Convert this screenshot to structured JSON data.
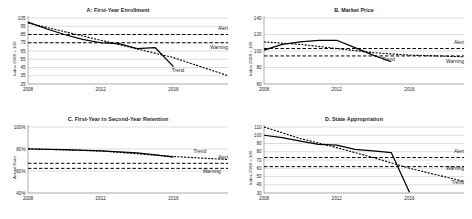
{
  "figure": {
    "width": 472,
    "height": 219,
    "background": "#ffffff",
    "line_color": "#000000",
    "grid_color": "#a7a9ac"
  },
  "chart_data": [
    {
      "type": "line",
      "panel": "A",
      "title": "A: First-Year Enrollment",
      "xlabel": "",
      "ylabel": "Index 2008 = 100",
      "xlim": [
        2008,
        2019
      ],
      "ylim": [
        25,
        105
      ],
      "yticks": [
        25,
        35,
        45,
        55,
        65,
        75,
        85,
        95,
        105
      ],
      "ytick_labels": [
        "25",
        "35",
        "45",
        "55",
        "65",
        "75",
        "85",
        "95",
        "105"
      ],
      "xticks": [
        2008,
        2012,
        2016
      ],
      "xtick_labels": [
        "2008",
        "2012",
        "2016"
      ],
      "grid": true,
      "legend": "inline-annotations",
      "series": [
        {
          "name": "Actual",
          "style": "solid",
          "x": [
            2008,
            2009,
            2010,
            2011,
            2012,
            2013,
            2014,
            2015,
            2016
          ],
          "values": [
            100,
            92,
            85,
            79,
            75,
            74,
            68,
            69,
            46
          ]
        },
        {
          "name": "Trend",
          "style": "dotted",
          "x": [
            2008,
            2012,
            2016,
            2019
          ],
          "values": [
            99,
            78,
            57,
            35
          ]
        },
        {
          "name": "Alert",
          "style": "dashed",
          "x": [
            2008,
            2019
          ],
          "values": [
            85,
            85
          ]
        },
        {
          "name": "Warning",
          "style": "dashed",
          "x": [
            2008,
            2019
          ],
          "values": [
            75,
            75
          ]
        }
      ],
      "annotations": [
        {
          "text": "Alert",
          "x": 2019,
          "y": 91
        },
        {
          "text": "Warning",
          "x": 2019,
          "y": 68
        },
        {
          "text": "Trend",
          "x": 2016.6,
          "y": 40
        }
      ]
    },
    {
      "type": "line",
      "panel": "B",
      "title": "B. Market Price",
      "xlabel": "",
      "ylabel": "Index 2008 = 100",
      "xlim": [
        2008,
        2019
      ],
      "ylim": [
        60,
        140
      ],
      "yticks": [
        60,
        80,
        100,
        120,
        140
      ],
      "ytick_labels": [
        "60",
        "80",
        "100",
        "120",
        "140"
      ],
      "xticks": [
        2008,
        2012,
        2016
      ],
      "xtick_labels": [
        "2008",
        "2012",
        "2016"
      ],
      "grid": true,
      "legend": "inline-annotations",
      "series": [
        {
          "name": "Actual",
          "style": "solid",
          "x": [
            2008,
            2009,
            2010,
            2011,
            2012,
            2013,
            2014,
            2015
          ],
          "values": [
            101,
            108,
            111,
            113,
            113,
            104,
            95,
            87
          ]
        },
        {
          "name": "Trend",
          "style": "dotted",
          "x": [
            2008,
            2010,
            2012,
            2014,
            2016,
            2019
          ],
          "values": [
            111,
            108,
            103,
            98,
            95,
            93
          ]
        },
        {
          "name": "Alert",
          "style": "dashed",
          "x": [
            2008,
            2019
          ],
          "values": [
            103,
            103
          ]
        },
        {
          "name": "Warning",
          "style": "dashed",
          "x": [
            2008,
            2019
          ],
          "values": [
            94,
            94
          ]
        }
      ],
      "annotations": [
        {
          "text": "Alert",
          "x": 2019,
          "y": 108
        },
        {
          "text": "Warning",
          "x": 2019,
          "y": 86
        },
        {
          "text": "Trend",
          "x": 2015.2,
          "y": 88
        }
      ]
    },
    {
      "type": "line",
      "panel": "C",
      "title": "C. First-Year to Second-Year Retention",
      "xlabel": "",
      "ylabel": "Actual Rate",
      "xlim": [
        2008,
        2019
      ],
      "ylim": [
        40,
        100
      ],
      "yticks": [
        40,
        60,
        80,
        100
      ],
      "ytick_labels": [
        "40%",
        "60%",
        "80%",
        "100%"
      ],
      "xticks": [
        2008,
        2012,
        2016
      ],
      "xtick_labels": [
        "2008",
        "2012",
        "2016"
      ],
      "grid": true,
      "legend": "inline-annotations",
      "series": [
        {
          "name": "Actual",
          "style": "solid",
          "x": [
            2008,
            2010,
            2012,
            2014,
            2015,
            2016
          ],
          "values": [
            80,
            79.4,
            78.4,
            76.4,
            74.6,
            72.6
          ]
        },
        {
          "name": "Trend",
          "style": "dotted",
          "x": [
            2008,
            2012,
            2016,
            2019
          ],
          "values": [
            80.2,
            78.2,
            73.2,
            70.4
          ]
        },
        {
          "name": "Alert",
          "style": "dashed",
          "x": [
            2008,
            2019
          ],
          "values": [
            67,
            67
          ]
        },
        {
          "name": "Warning",
          "style": "dashed",
          "x": [
            2008,
            2019
          ],
          "values": [
            62.4,
            62.4
          ]
        }
      ],
      "annotations": [
        {
          "text": "Trend",
          "x": 2017.8,
          "y": 76.5
        },
        {
          "text": "Alert",
          "x": 2019,
          "y": 70.5
        },
        {
          "text": "Warning",
          "x": 2018.6,
          "y": 58.5
        }
      ]
    },
    {
      "type": "line",
      "panel": "D",
      "title": "D. State Appropriation",
      "xlabel": "",
      "ylabel": "Index 2008 = 100",
      "xlim": [
        2008,
        2019
      ],
      "ylim": [
        30,
        110
      ],
      "yticks": [
        30,
        40,
        50,
        60,
        70,
        80,
        90,
        100,
        110
      ],
      "ytick_labels": [
        "30",
        "40",
        "50",
        "60",
        "70",
        "80",
        "90",
        "100",
        "110"
      ],
      "xticks": [
        2008,
        2012,
        2016
      ],
      "xtick_labels": [
        "2008",
        "2012",
        "2016"
      ],
      "grid": true,
      "legend": "inline-annotations",
      "series": [
        {
          "name": "Actual",
          "style": "solid",
          "x": [
            2008,
            2009,
            2010,
            2011,
            2012,
            2013,
            2014,
            2015,
            2016
          ],
          "values": [
            100,
            97,
            93,
            89,
            88,
            83,
            81,
            79,
            31
          ]
        },
        {
          "name": "Trend",
          "style": "dotted",
          "x": [
            2008,
            2010,
            2012,
            2014,
            2016,
            2019
          ],
          "values": [
            110,
            96,
            85,
            73,
            60,
            44
          ]
        },
        {
          "name": "Alert",
          "style": "dashed",
          "x": [
            2008,
            2019
          ],
          "values": [
            73,
            73
          ]
        },
        {
          "name": "Warning",
          "style": "dashed",
          "x": [
            2008,
            2019
          ],
          "values": [
            62,
            62
          ]
        }
      ],
      "annotations": [
        {
          "text": "Alert",
          "x": 2019,
          "y": 78
        },
        {
          "text": "Warning",
          "x": 2019,
          "y": 58
        },
        {
          "text": "Trend",
          "x": 2019,
          "y": 41
        }
      ]
    }
  ]
}
